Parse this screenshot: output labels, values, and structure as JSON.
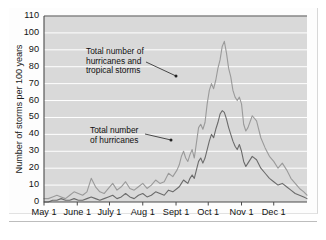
{
  "figure": {
    "plot_background": "#d9d9d9",
    "gridline_color": "#ffffff",
    "axis_color": "#4a4a4a",
    "series_colors": {
      "storms": "#9a9a9a",
      "hurricanes": "#6b6b6b"
    }
  },
  "annotations": [
    {
      "id": "storms-label",
      "lines": [
        "Total number of",
        "hurricanes and",
        "tropical storms"
      ],
      "line1": "Total number of",
      "line2": "hurricanes and",
      "line3": "tropical storms"
    },
    {
      "id": "hurricanes-label",
      "lines": [
        "Total number",
        "of hurricanes"
      ],
      "line1": "Total number",
      "line2": "of hurricanes"
    }
  ],
  "chart_data": {
    "type": "line",
    "title": "",
    "xlabel": "",
    "ylabel": "Number of storms per 100 years",
    "ylim": [
      0,
      110
    ],
    "yticks": [
      0,
      10,
      20,
      30,
      40,
      50,
      60,
      70,
      80,
      90,
      100,
      110
    ],
    "ytick_labels": [
      "0",
      "10",
      "20",
      "30",
      "40",
      "50",
      "60",
      "70",
      "80",
      "90",
      "100",
      "110"
    ],
    "xlim": [
      "May 1",
      "Dec 31"
    ],
    "xticks": [
      "May 1",
      "June 1",
      "July 1",
      "Aug 1",
      "Sept 1",
      "Oct 1",
      "Nov 1",
      "Dec 1"
    ],
    "xtick_labels": [
      "May 1",
      "June 1",
      "July 1",
      "Aug 1",
      "Sept 1",
      "Oct 1",
      "Nov 1",
      "Dec 1"
    ],
    "grid": true,
    "grid_axis": "y",
    "legend": "annotated-inline",
    "x_day_offsets": [
      0,
      31,
      61,
      92,
      123,
      153,
      184,
      214,
      245
    ],
    "series": [
      {
        "name": "Total number of hurricanes and tropical storms",
        "color": "#9a9a9a",
        "x_days": [
          0,
          4,
          8,
          12,
          16,
          20,
          24,
          28,
          32,
          36,
          40,
          44,
          48,
          52,
          56,
          60,
          64,
          68,
          72,
          76,
          80,
          84,
          88,
          92,
          96,
          100,
          104,
          108,
          112,
          116,
          120,
          124,
          126,
          128,
          130,
          132,
          134,
          136,
          138,
          140,
          142,
          144,
          146,
          148,
          150,
          152,
          154,
          156,
          158,
          160,
          162,
          164,
          166,
          168,
          170,
          172,
          174,
          176,
          178,
          180,
          182,
          184,
          186,
          188,
          190,
          194,
          198,
          202,
          206,
          210,
          214,
          218,
          222,
          226,
          230,
          234,
          238,
          242,
          245
        ],
        "values": [
          2,
          2,
          3,
          4,
          3,
          2,
          4,
          6,
          5,
          4,
          6,
          14,
          9,
          6,
          5,
          8,
          11,
          7,
          9,
          12,
          8,
          7,
          9,
          11,
          8,
          10,
          13,
          11,
          12,
          17,
          15,
          19,
          22,
          27,
          30,
          26,
          24,
          28,
          31,
          26,
          35,
          44,
          46,
          43,
          47,
          58,
          66,
          70,
          67,
          72,
          79,
          84,
          92,
          95,
          88,
          79,
          74,
          66,
          62,
          60,
          62,
          58,
          46,
          42,
          44,
          51,
          48,
          38,
          32,
          27,
          24,
          20,
          23,
          19,
          14,
          11,
          8,
          6,
          4
        ]
      },
      {
        "name": "Total number of hurricanes",
        "color": "#6b6b6b",
        "x_days": [
          0,
          4,
          8,
          12,
          16,
          20,
          24,
          28,
          32,
          36,
          40,
          44,
          48,
          52,
          56,
          60,
          64,
          68,
          72,
          76,
          80,
          84,
          88,
          92,
          96,
          100,
          104,
          108,
          112,
          116,
          120,
          124,
          126,
          128,
          130,
          132,
          134,
          136,
          138,
          140,
          142,
          144,
          146,
          148,
          150,
          152,
          154,
          156,
          158,
          160,
          162,
          164,
          166,
          168,
          170,
          172,
          174,
          176,
          178,
          180,
          182,
          184,
          186,
          188,
          190,
          194,
          198,
          202,
          206,
          210,
          214,
          218,
          222,
          226,
          230,
          234,
          238,
          242,
          245
        ],
        "values": [
          0,
          0,
          1,
          1,
          2,
          1,
          1,
          2,
          1,
          1,
          2,
          3,
          2,
          1,
          2,
          3,
          4,
          2,
          3,
          5,
          3,
          2,
          4,
          5,
          3,
          4,
          6,
          5,
          4,
          7,
          6,
          8,
          9,
          11,
          13,
          12,
          11,
          14,
          16,
          14,
          19,
          24,
          26,
          23,
          26,
          31,
          36,
          40,
          38,
          43,
          47,
          52,
          54,
          53,
          49,
          44,
          40,
          36,
          33,
          31,
          34,
          30,
          24,
          21,
          23,
          27,
          25,
          20,
          17,
          14,
          12,
          10,
          11,
          9,
          7,
          5,
          4,
          3,
          2
        ]
      }
    ],
    "peaks": {
      "storms_peak_value": 95,
      "storms_peak_date": "Sept 10",
      "hurricanes_peak_value": 54,
      "hurricanes_peak_date": "Sept 10"
    }
  }
}
